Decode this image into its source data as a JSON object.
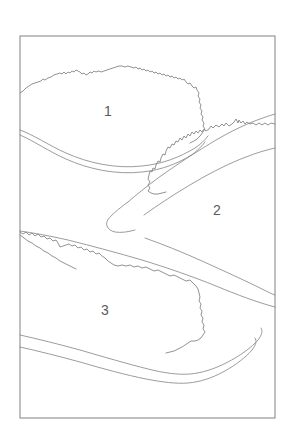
{
  "figure": {
    "title": "",
    "background_color": "#ffffff",
    "line_color": "#7e7e7e",
    "frame_color": "#8d8d8d",
    "label_color": "#5a5a5a",
    "frame": {
      "x": 20,
      "y": 36,
      "width": 255,
      "height": 382
    },
    "regions": [
      {
        "id": "region-1",
        "label": "1",
        "label_x": 108,
        "label_y": 112,
        "boundary_style": "jagged-top-smooth-bottom",
        "position": "upper-left"
      },
      {
        "id": "region-2",
        "label": "2",
        "label_x": 217,
        "label_y": 211,
        "boundary_style": "jagged-left-smooth-right",
        "position": "middle-right"
      },
      {
        "id": "region-3",
        "label": "3",
        "label_x": 105,
        "label_y": 311,
        "boundary_style": "jagged-top-smooth-bottom",
        "position": "lower-left"
      }
    ]
  }
}
